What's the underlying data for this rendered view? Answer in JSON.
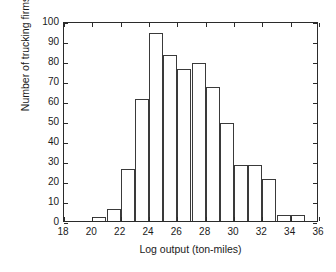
{
  "chart_data": {
    "type": "bar",
    "title": "",
    "xlabel": "Log output (ton-miles)",
    "ylabel": "Number of trucking firms",
    "xlim": [
      18,
      36
    ],
    "ylim": [
      0,
      100
    ],
    "grid": false,
    "legend": null,
    "bin_width": 1,
    "xticks": [
      18,
      20,
      22,
      24,
      26,
      28,
      30,
      32,
      34,
      36
    ],
    "xtick_labels": [
      "18",
      "20",
      "22",
      "24",
      "26",
      "28",
      "30",
      "32",
      "34",
      "36"
    ],
    "yticks": [
      0,
      10,
      20,
      30,
      40,
      50,
      60,
      70,
      80,
      90,
      100
    ],
    "ytick_labels": [
      "0",
      "10",
      "20",
      "30",
      "40",
      "50",
      "60",
      "70",
      "80",
      "90",
      "100"
    ],
    "bins": [
      {
        "left": 20,
        "right": 21,
        "value": 2
      },
      {
        "left": 21,
        "right": 22,
        "value": 6
      },
      {
        "left": 22,
        "right": 23,
        "value": 26
      },
      {
        "left": 23,
        "right": 24,
        "value": 61
      },
      {
        "left": 24,
        "right": 25,
        "value": 94
      },
      {
        "left": 25,
        "right": 26,
        "value": 83
      },
      {
        "left": 26,
        "right": 27,
        "value": 76
      },
      {
        "left": 27,
        "right": 28,
        "value": 79
      },
      {
        "left": 28,
        "right": 29,
        "value": 67
      },
      {
        "left": 29,
        "right": 30,
        "value": 49
      },
      {
        "left": 30,
        "right": 31,
        "value": 28
      },
      {
        "left": 31,
        "right": 32,
        "value": 28
      },
      {
        "left": 32,
        "right": 33,
        "value": 21
      },
      {
        "left": 33,
        "right": 34,
        "value": 3
      },
      {
        "left": 34,
        "right": 35,
        "value": 3
      }
    ],
    "categories": [
      "20-21",
      "21-22",
      "22-23",
      "23-24",
      "24-25",
      "25-26",
      "26-27",
      "27-28",
      "28-29",
      "29-30",
      "30-31",
      "31-32",
      "32-33",
      "33-34",
      "34-35"
    ],
    "values": [
      2,
      6,
      26,
      61,
      94,
      83,
      76,
      79,
      67,
      49,
      28,
      28,
      21,
      3,
      3
    ],
    "colors": {
      "bar_fill": "#ffffff",
      "bar_edge": "#3a3a3a",
      "axis": "#2b2b2b",
      "text": "#1a1a1a",
      "background": "#ffffff"
    }
  }
}
